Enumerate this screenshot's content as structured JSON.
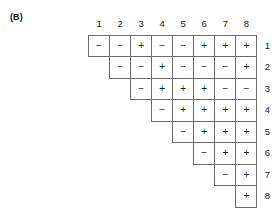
{
  "figure": {
    "panel_label": "(B)",
    "column_headers": [
      "1",
      "2",
      "3",
      "4",
      "5",
      "6",
      "7",
      "8"
    ],
    "row_labels": [
      "1",
      "2",
      "3",
      "4",
      "5",
      "6",
      "7",
      "8"
    ],
    "grid_line_color": "#6b6b6b",
    "text_color": "#1a1a1a",
    "background_color": "#ffffff"
  },
  "chart_data": {
    "type": "table",
    "title": "(B)",
    "xlabel": "",
    "ylabel": "",
    "layout": "upper-triangular staircase; row i spans columns i through 8",
    "categories": [
      "1",
      "2",
      "3",
      "4",
      "5",
      "6",
      "7",
      "8"
    ],
    "row_categories": [
      "1",
      "2",
      "3",
      "4",
      "5",
      "6",
      "7",
      "8"
    ],
    "symbols": [
      "+",
      "−"
    ],
    "rows": [
      {
        "label": "1",
        "start_column": 1,
        "values": [
          "−",
          "−",
          "+",
          "−",
          "−",
          "+",
          "+",
          "+"
        ]
      },
      {
        "label": "2",
        "start_column": 2,
        "values": [
          "−",
          "−",
          "+",
          "−",
          "−",
          "−",
          "+"
        ]
      },
      {
        "label": "3",
        "start_column": 3,
        "values": [
          "−",
          "+",
          "+",
          "+",
          "−",
          "−"
        ]
      },
      {
        "label": "4",
        "start_column": 4,
        "values": [
          "−",
          "+",
          "+",
          "+",
          "+"
        ]
      },
      {
        "label": "5",
        "start_column": 5,
        "values": [
          "−",
          "+",
          "+",
          "+"
        ]
      },
      {
        "label": "6",
        "start_column": 6,
        "values": [
          "−",
          "+",
          "+"
        ]
      },
      {
        "label": "7",
        "start_column": 7,
        "values": [
          "−",
          "+"
        ]
      },
      {
        "label": "8",
        "start_column": 8,
        "values": [
          "+"
        ]
      }
    ]
  }
}
